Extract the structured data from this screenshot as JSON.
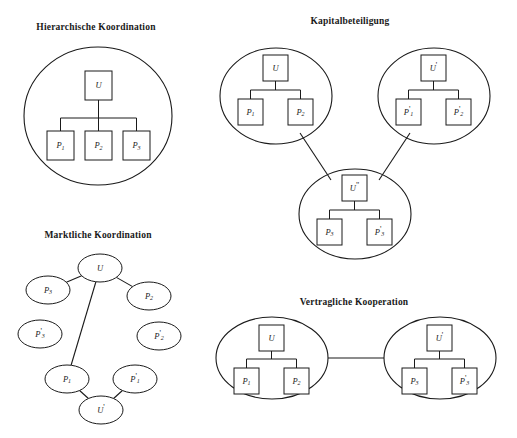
{
  "figure": {
    "background_color": "#ffffff",
    "line_color": "#1a1a1a",
    "panels": [
      {
        "id": "hierarchische-koordination",
        "title": "Hierarchische Koordination",
        "title_x": 96,
        "title_y": 30,
        "groups": [
          {
            "id": "group-u",
            "cx": 98,
            "cy": 116,
            "rx": 74,
            "ry": 69,
            "root": {
              "label": "U",
              "base": "U",
              "sub": "",
              "prime": "",
              "x": 85,
              "y": 71,
              "w": 27,
              "h": 29
            },
            "children": [
              {
                "label": "P1",
                "base": "P",
                "sub": "1",
                "prime": "",
                "x": 47,
                "y": 131,
                "w": 27,
                "h": 29
              },
              {
                "label": "P2",
                "base": "P",
                "sub": "2",
                "prime": "",
                "x": 85,
                "y": 131,
                "w": 27,
                "h": 29
              },
              {
                "label": "P3",
                "base": "P",
                "sub": "3",
                "prime": "",
                "x": 123,
                "y": 131,
                "w": 27,
                "h": 29
              }
            ],
            "bus_y": 118
          }
        ],
        "links": []
      },
      {
        "id": "kapitalbeteiligung",
        "title": "Kapitalbeteiligung",
        "title_x": 350,
        "title_y": 24,
        "groups": [
          {
            "id": "group-u-left",
            "cx": 276,
            "cy": 96,
            "rx": 56,
            "ry": 48,
            "root": {
              "label": "U",
              "base": "U",
              "sub": "",
              "prime": "",
              "x": 263,
              "y": 55,
              "w": 25,
              "h": 26
            },
            "children": [
              {
                "label": "P1",
                "base": "P",
                "sub": "1",
                "prime": "",
                "x": 238,
                "y": 99,
                "w": 25,
                "h": 26
              },
              {
                "label": "P2",
                "base": "P",
                "sub": "2",
                "prime": "",
                "x": 288,
                "y": 99,
                "w": 25,
                "h": 26
              }
            ],
            "bus_y": 90
          },
          {
            "id": "group-u-prime-right",
            "cx": 434,
            "cy": 96,
            "rx": 56,
            "ry": 48,
            "root": {
              "label": "U'",
              "base": "U",
              "sub": "",
              "prime": "'",
              "x": 421,
              "y": 55,
              "w": 25,
              "h": 26
            },
            "children": [
              {
                "label": "P'1",
                "base": "P",
                "sub": "1",
                "prime": "'",
                "x": 396,
                "y": 99,
                "w": 25,
                "h": 26
              },
              {
                "label": "P'2",
                "base": "P",
                "sub": "2",
                "prime": "'",
                "x": 446,
                "y": 99,
                "w": 25,
                "h": 26
              }
            ],
            "bus_y": 90
          },
          {
            "id": "group-u-doubleprime-bottom",
            "cx": 355,
            "cy": 214,
            "rx": 56,
            "ry": 45,
            "root": {
              "label": "U\"",
              "base": "U",
              "sub": "",
              "prime": "\"",
              "x": 342,
              "y": 175,
              "w": 25,
              "h": 26
            },
            "children": [
              {
                "label": "P3",
                "base": "P",
                "sub": "3",
                "prime": "",
                "x": 317,
                "y": 219,
                "w": 25,
                "h": 26
              },
              {
                "label": "P'3",
                "base": "P",
                "sub": "3",
                "prime": "'",
                "x": 367,
                "y": 219,
                "w": 25,
                "h": 26
              }
            ],
            "bus_y": 210
          }
        ],
        "links": [
          {
            "id": "link-left-to-bottom",
            "x1": 300,
            "y1": 133,
            "x2": 331,
            "y2": 180
          },
          {
            "id": "link-right-to-bottom",
            "x1": 410,
            "y1": 133,
            "x2": 379,
            "y2": 180
          }
        ]
      },
      {
        "id": "marktliche-koordination",
        "title": "Marktliche Koordination",
        "title_x": 98,
        "title_y": 238,
        "nodes": [
          {
            "id": "node-u",
            "label": "U",
            "base": "U",
            "sub": "",
            "prime": "",
            "cx": 100,
            "cy": 268,
            "rx": 22,
            "ry": 14
          },
          {
            "id": "node-p3",
            "label": "P3",
            "base": "P",
            "sub": "3",
            "prime": "",
            "cx": 48,
            "cy": 290,
            "rx": 22,
            "ry": 14
          },
          {
            "id": "node-p2",
            "label": "P2",
            "base": "P",
            "sub": "2",
            "prime": "",
            "cx": 149,
            "cy": 296,
            "rx": 22,
            "ry": 14
          },
          {
            "id": "node-p3prime",
            "label": "P'3",
            "base": "P",
            "sub": "3",
            "prime": "'",
            "cx": 40,
            "cy": 334,
            "rx": 22,
            "ry": 14
          },
          {
            "id": "node-p2prime",
            "label": "P'2",
            "base": "P",
            "sub": "2",
            "prime": "'",
            "cx": 159,
            "cy": 336,
            "rx": 22,
            "ry": 14
          },
          {
            "id": "node-p1",
            "label": "P1",
            "base": "P",
            "sub": "1",
            "prime": "",
            "cx": 67,
            "cy": 379,
            "rx": 22,
            "ry": 14
          },
          {
            "id": "node-p1prime",
            "label": "P'1",
            "base": "P",
            "sub": "1",
            "prime": "'",
            "cx": 135,
            "cy": 379,
            "rx": 22,
            "ry": 14
          },
          {
            "id": "node-uprime",
            "label": "U'",
            "base": "U",
            "sub": "",
            "prime": "'",
            "cx": 101,
            "cy": 410,
            "rx": 22,
            "ry": 14
          }
        ],
        "edges": [
          {
            "id": "edge-u-p3",
            "from": "node-u",
            "to": "node-p3"
          },
          {
            "id": "edge-u-p2",
            "from": "node-u",
            "to": "node-p2"
          },
          {
            "id": "edge-u-p1",
            "from": "node-u",
            "to": "node-p1"
          },
          {
            "id": "edge-p1-uprime",
            "from": "node-p1",
            "to": "node-uprime"
          },
          {
            "id": "edge-uprime-p1prime",
            "from": "node-uprime",
            "to": "node-p1prime"
          }
        ]
      },
      {
        "id": "vertragliche-kooperation",
        "title": "Vertragliche Kooperation",
        "title_x": 354,
        "title_y": 305,
        "groups": [
          {
            "id": "group-u-left-vk",
            "cx": 272,
            "cy": 358,
            "rx": 56,
            "ry": 41,
            "root": {
              "label": "U",
              "base": "U",
              "sub": "",
              "prime": "",
              "x": 259,
              "y": 325,
              "w": 25,
              "h": 26
            },
            "children": [
              {
                "label": "P1",
                "base": "P",
                "sub": "1",
                "prime": "",
                "x": 234,
                "y": 368,
                "w": 25,
                "h": 26
              },
              {
                "label": "P2",
                "base": "P",
                "sub": "2",
                "prime": "",
                "x": 284,
                "y": 368,
                "w": 25,
                "h": 26
              }
            ],
            "bus_y": 359
          },
          {
            "id": "group-u-prime-right-vk",
            "cx": 440,
            "cy": 358,
            "rx": 56,
            "ry": 41,
            "root": {
              "label": "U'",
              "base": "U",
              "sub": "",
              "prime": "'",
              "x": 427,
              "y": 325,
              "w": 25,
              "h": 26
            },
            "children": [
              {
                "label": "P3",
                "base": "P",
                "sub": "3",
                "prime": "",
                "x": 402,
                "y": 368,
                "w": 25,
                "h": 26
              },
              {
                "label": "P'3",
                "base": "P",
                "sub": "3",
                "prime": "'",
                "x": 452,
                "y": 368,
                "w": 25,
                "h": 26
              }
            ],
            "bus_y": 359
          }
        ],
        "links": [
          {
            "id": "link-vk-left-right",
            "x1": 328,
            "y1": 358,
            "x2": 384,
            "y2": 358
          }
        ]
      }
    ]
  }
}
